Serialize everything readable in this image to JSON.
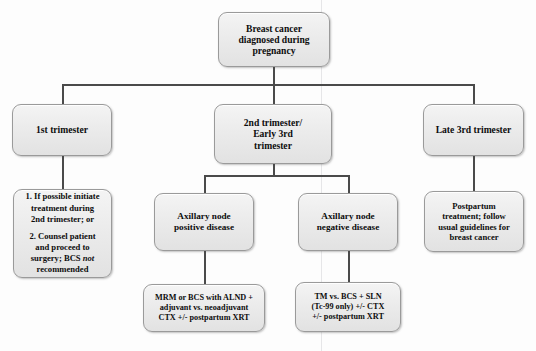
{
  "diagram": {
    "type": "flowchart",
    "background_color": "#fdfdfd",
    "node_fill_color": "#ececec",
    "node_border_color": "#9a9a9a",
    "connector_color": "#4a4a4a",
    "text_color": "#0d0d0d"
  },
  "nodes": {
    "root": {
      "label": "Breast cancer\ndiagnosed during\npregnancy"
    },
    "first_trimester": {
      "label": "1st trimester"
    },
    "second_early_third_trimester": {
      "label": "2nd trimester/\nEarly 3rd\ntrimester"
    },
    "late_third_trimester": {
      "label": "Late 3rd trimester"
    },
    "first_trimester_options": {
      "item1": "1. If possible initiate\ntreatment during\n2nd trimester; or",
      "item2_prefix": "2. Counsel patient\nand proceed to\nsurgery; BCS ",
      "item2_italic": "not",
      "item2_suffix": "\nrecommended"
    },
    "axillary_node_positive": {
      "label": "Axillary node\npositive disease"
    },
    "axillary_node_negative": {
      "label": "Axillary node\nnegative disease"
    },
    "postpartum_treatment": {
      "label": "Postpartum\ntreatment; follow\nusual guidelines for\nbreast cancer"
    },
    "node_positive_treatment": {
      "label": "MRM or BCS with ALND +\nadjuvant vs. neoadjuvant\nCTX +/- postpartum XRT"
    },
    "node_negative_treatment": {
      "label": "TM vs. BCS + SLN\n(Tc-99 only) +/- CTX\n+/- postpartum XRT"
    }
  }
}
